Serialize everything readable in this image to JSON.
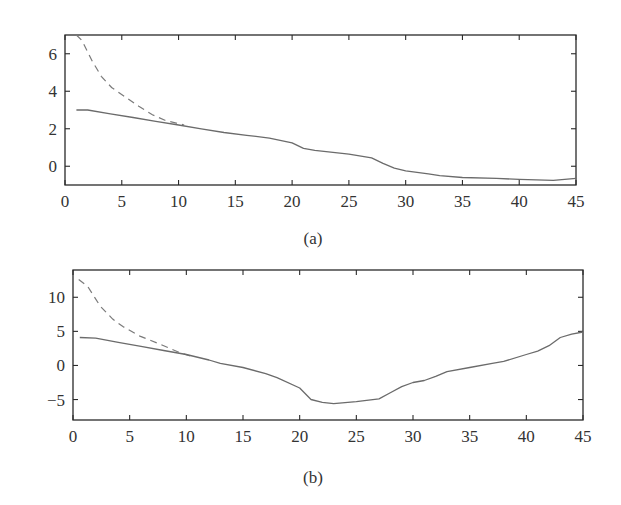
{
  "chart_data": [
    {
      "id": "a",
      "type": "line",
      "caption": "(a)",
      "title": "",
      "xlabel": "",
      "ylabel": "",
      "xlim": [
        0,
        45
      ],
      "ylim": [
        -1,
        7
      ],
      "xticks": [
        0,
        5,
        10,
        15,
        20,
        25,
        30,
        35,
        40,
        45
      ],
      "yticks": [
        0,
        2,
        4,
        6
      ],
      "grid": false,
      "legend": null,
      "series": [
        {
          "name": "solid",
          "style": "solid",
          "color": "#6b6b6b",
          "x": [
            1,
            2,
            4,
            6,
            8,
            10,
            12,
            14,
            16,
            18,
            20,
            21,
            22,
            25,
            27,
            28,
            29,
            30,
            32,
            33,
            35,
            38,
            40,
            43,
            45
          ],
          "y": [
            3.0,
            3.0,
            2.8,
            2.6,
            2.4,
            2.2,
            2.0,
            1.8,
            1.65,
            1.5,
            1.25,
            0.95,
            0.85,
            0.65,
            0.45,
            0.15,
            -0.1,
            -0.25,
            -0.4,
            -0.5,
            -0.6,
            -0.65,
            -0.7,
            -0.75,
            -0.65
          ]
        },
        {
          "name": "dashed",
          "style": "dashed",
          "color": "#7a7a7a",
          "x": [
            1,
            1.5,
            2.4,
            3.2,
            4.1,
            5.3,
            6.5,
            7.7,
            8.8,
            9.8,
            10.5
          ],
          "y": [
            7.0,
            6.7,
            5.6,
            4.8,
            4.2,
            3.7,
            3.2,
            2.75,
            2.45,
            2.3,
            2.2
          ]
        }
      ]
    },
    {
      "id": "b",
      "type": "line",
      "caption": "(b)",
      "title": "",
      "xlabel": "",
      "ylabel": "",
      "xlim": [
        0,
        45
      ],
      "ylim": [
        -8,
        14
      ],
      "xticks": [
        0,
        5,
        10,
        15,
        20,
        25,
        30,
        35,
        40,
        45
      ],
      "yticks": [
        -5,
        0,
        5,
        10
      ],
      "grid": false,
      "legend": null,
      "series": [
        {
          "name": "solid",
          "style": "solid",
          "color": "#6b6b6b",
          "x": [
            0.6,
            2,
            4,
            6,
            8,
            10,
            12,
            13,
            15,
            17,
            18,
            20,
            21,
            22,
            23,
            25,
            27,
            28,
            29,
            30,
            31,
            32,
            33,
            35,
            37,
            38,
            40,
            41,
            42,
            43,
            44,
            45
          ],
          "y": [
            4.1,
            4.0,
            3.4,
            2.8,
            2.2,
            1.6,
            0.8,
            0.3,
            -0.3,
            -1.2,
            -1.8,
            -3.3,
            -5.0,
            -5.4,
            -5.6,
            -5.3,
            -4.9,
            -4.0,
            -3.1,
            -2.5,
            -2.2,
            -1.6,
            -0.9,
            -0.3,
            0.3,
            0.6,
            1.6,
            2.1,
            2.9,
            4.1,
            4.6,
            4.9
          ]
        },
        {
          "name": "dashed",
          "style": "dashed",
          "color": "#7a7a7a",
          "x": [
            0.5,
            1.3,
            2.4,
            3.5,
            4.4,
            5.9,
            7.7,
            9.4,
            10.5
          ],
          "y": [
            12.6,
            11.6,
            8.7,
            6.8,
            5.7,
            4.3,
            3.1,
            1.9,
            1.3
          ]
        }
      ]
    }
  ],
  "layout": {
    "panels": [
      {
        "left": 65,
        "top": 35,
        "right": 576,
        "bottom": 185,
        "caption_x": 313,
        "caption_y": 244
      },
      {
        "left": 73,
        "top": 270,
        "right": 583,
        "bottom": 420,
        "caption_x": 313,
        "caption_y": 483
      }
    ]
  }
}
